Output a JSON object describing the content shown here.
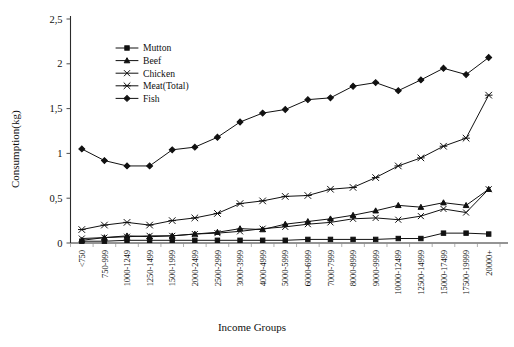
{
  "chart_data": {
    "type": "line",
    "title": "",
    "xlabel": "Income Groups",
    "ylabel": "Consumption(kg)",
    "ylim": [
      0,
      2.5
    ],
    "ytick_labels": [
      "0",
      "0,5",
      "1",
      "1,5",
      "2",
      "2,5"
    ],
    "ytick_values": [
      0,
      0.5,
      1,
      1.5,
      2,
      2.5
    ],
    "grid": false,
    "legend_position": "upper-left-inside",
    "categories": [
      "<750",
      "750-999",
      "1000-1249",
      "1250-1499",
      "1500-1999",
      "2000-2499",
      "2500-2999",
      "3000-3999",
      "4000-4999",
      "5000-5999",
      "6000-6999",
      "7000-7999",
      "8000-8999",
      "9000-9999",
      "10000-12499",
      "12500-14999",
      "15000-17499",
      "17500-19999",
      "20000+"
    ],
    "series": [
      {
        "name": "Mutton",
        "marker": "filled-square",
        "values": [
          0.02,
          0.02,
          0.03,
          0.03,
          0.03,
          0.03,
          0.03,
          0.03,
          0.03,
          0.03,
          0.04,
          0.04,
          0.04,
          0.04,
          0.05,
          0.05,
          0.11,
          0.11,
          0.1
        ]
      },
      {
        "name": "Beef",
        "marker": "triangle",
        "values": [
          0.03,
          0.06,
          0.08,
          0.07,
          0.08,
          0.1,
          0.12,
          0.16,
          0.15,
          0.21,
          0.24,
          0.27,
          0.31,
          0.36,
          0.42,
          0.4,
          0.45,
          0.42,
          0.6
        ]
      },
      {
        "name": "Chicken",
        "marker": "cross-x",
        "values": [
          0.05,
          0.06,
          0.07,
          0.08,
          0.08,
          0.1,
          0.11,
          0.13,
          0.16,
          0.18,
          0.21,
          0.23,
          0.27,
          0.28,
          0.26,
          0.3,
          0.38,
          0.34,
          0.6
        ]
      },
      {
        "name": "Meat(Total)",
        "marker": "star-x",
        "values": [
          0.15,
          0.2,
          0.23,
          0.2,
          0.25,
          0.28,
          0.33,
          0.44,
          0.47,
          0.52,
          0.53,
          0.6,
          0.62,
          0.73,
          0.86,
          0.95,
          1.08,
          1.17,
          1.65
        ]
      },
      {
        "name": "Fish",
        "marker": "filled-diamond",
        "values": [
          1.05,
          0.92,
          0.86,
          0.86,
          1.04,
          1.07,
          1.18,
          1.35,
          1.45,
          1.49,
          1.6,
          1.62,
          1.75,
          1.79,
          1.7,
          1.82,
          1.95,
          1.88,
          2.07
        ]
      }
    ]
  },
  "legend": {
    "items": [
      {
        "label": "Mutton"
      },
      {
        "label": "Beef"
      },
      {
        "label": "Chicken"
      },
      {
        "label": "Meat(Total)"
      },
      {
        "label": "Fish"
      }
    ]
  }
}
